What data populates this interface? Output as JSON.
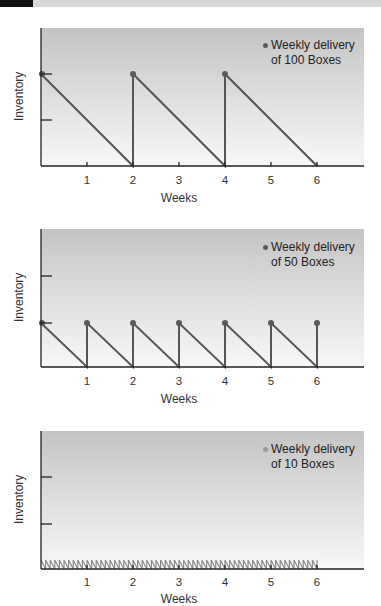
{
  "header": {
    "bar_color": "#d7d7d7",
    "block_color": "#111111"
  },
  "colors": {
    "line": "#555555",
    "dot_dark": "#5a5a5a",
    "dot_light": "#9a9a9a",
    "zigzag": "#8c8c8c",
    "axis": "#222222",
    "bg_top": "#c4c4c4",
    "bg_bottom": "#f7f7f7"
  },
  "charts": [
    {
      "ylabel": "Inventory",
      "xlabel": "Weeks",
      "xticks": [
        "1",
        "2",
        "3",
        "4",
        "5",
        "6"
      ],
      "legend_line1": "Weekly delivery",
      "legend_line2": "of 100 Boxes"
    },
    {
      "ylabel": "Inventory",
      "xlabel": "Weeks",
      "xticks": [
        "1",
        "2",
        "3",
        "4",
        "5",
        "6"
      ],
      "legend_line1": "Weekly delivery",
      "legend_line2": "of 50 Boxes"
    },
    {
      "ylabel": "Inventory",
      "xlabel": "Weeks",
      "xticks": [
        "1",
        "2",
        "3",
        "4",
        "5",
        "6"
      ],
      "legend_line1": "Weekly delivery",
      "legend_line2": "of 10 Boxes"
    }
  ],
  "chart_data": [
    {
      "type": "line",
      "title": "",
      "xlabel": "Weeks",
      "ylabel": "Inventory",
      "legend": [
        "Weekly delivery of 100 Boxes"
      ],
      "x": [
        0,
        2,
        2,
        4,
        4,
        6
      ],
      "values": [
        100,
        0,
        100,
        0,
        100,
        0
      ],
      "xlim": [
        0,
        7
      ],
      "ylim": [
        0,
        150
      ],
      "yticks": [
        50,
        100
      ],
      "markers_at": [
        [
          0,
          100
        ],
        [
          2,
          100
        ],
        [
          4,
          100
        ]
      ],
      "grid": false,
      "legend_position": "upper right"
    },
    {
      "type": "line",
      "title": "",
      "xlabel": "Weeks",
      "ylabel": "Inventory",
      "legend": [
        "Weekly delivery of 50 Boxes"
      ],
      "x": [
        0,
        1,
        1,
        2,
        2,
        3,
        3,
        4,
        4,
        5,
        5,
        6,
        6
      ],
      "values": [
        50,
        0,
        50,
        0,
        50,
        0,
        50,
        0,
        50,
        0,
        50,
        0,
        50
      ],
      "xlim": [
        0,
        7
      ],
      "ylim": [
        0,
        150
      ],
      "yticks": [
        50,
        100
      ],
      "markers_at": [
        [
          0,
          50
        ],
        [
          1,
          50
        ],
        [
          2,
          50
        ],
        [
          3,
          50
        ],
        [
          4,
          50
        ],
        [
          5,
          50
        ],
        [
          6,
          50
        ]
      ],
      "grid": false,
      "legend_position": "upper right"
    },
    {
      "type": "line",
      "title": "",
      "xlabel": "Weeks",
      "ylabel": "Inventory",
      "legend": [
        "Weekly delivery of 10 Boxes"
      ],
      "description": "sawtooth between 10 and 0 with ~10 cycles per week from week 0 to 6",
      "cycle_length_weeks": 0.1,
      "peak": 10,
      "trough": 0,
      "x_range": [
        0,
        6
      ],
      "xlim": [
        0,
        7
      ],
      "ylim": [
        0,
        150
      ],
      "yticks": [
        50,
        100
      ],
      "grid": false,
      "legend_position": "upper right"
    }
  ]
}
